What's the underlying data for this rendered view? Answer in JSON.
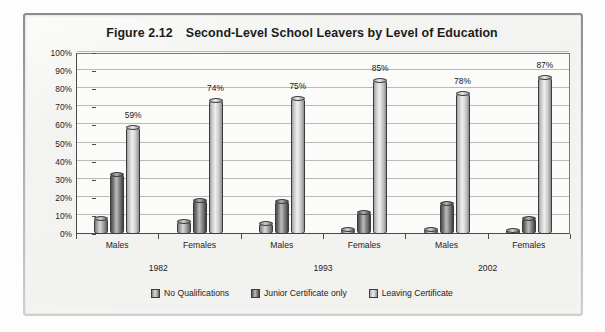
{
  "figure": {
    "label": "Figure 2.12",
    "title": "Second-Level School Leavers by Level of Education"
  },
  "chart_data": {
    "type": "bar",
    "xlabel": "",
    "ylabel": "",
    "ylim": [
      0,
      100
    ],
    "yticks": [
      "0%",
      "10%",
      "20%",
      "30%",
      "40%",
      "50%",
      "60%",
      "70%",
      "80%",
      "90%",
      "100%"
    ],
    "grid": true,
    "legend_position": "bottom",
    "categories": [
      "Males",
      "Females",
      "Males",
      "Females",
      "Males",
      "Females"
    ],
    "group_labels": [
      "1982",
      "1993",
      "2002"
    ],
    "series": [
      {
        "name": "No Qualifications",
        "values": [
          9,
          7,
          6,
          3,
          3,
          2
        ]
      },
      {
        "name": "Junior Certificate only",
        "values": [
          33,
          19,
          18,
          12,
          17,
          9
        ]
      },
      {
        "name": "Leaving Certificate",
        "values": [
          59,
          74,
          75,
          85,
          78,
          87
        ]
      }
    ],
    "data_labels": [
      "59%",
      "74%",
      "75%",
      "85%",
      "78%",
      "87%"
    ]
  },
  "yaxis": {
    "ticks": [
      "100%",
      "90%",
      "80%",
      "70%",
      "60%",
      "50%",
      "40%",
      "30%",
      "20%",
      "10%",
      "0%"
    ]
  },
  "xaxis": {
    "categories": [
      "Males",
      "Females",
      "Males",
      "Females",
      "Males",
      "Females"
    ],
    "years": [
      "1982",
      "1993",
      "2002"
    ]
  },
  "legend": {
    "items": [
      {
        "label": "No Qualifications"
      },
      {
        "label": "Junior Certificate only"
      },
      {
        "label": "Leaving Certificate"
      }
    ]
  },
  "colors": {
    "series_no_qualifications": "#a6a6a6",
    "series_junior_certificate": "#6e6e6e",
    "series_leaving_certificate": "#dcdcdc",
    "axis": "#4a4a4a",
    "gridline": "#b9b9b5",
    "plot_background": "#fbfbf9",
    "page_background": "#f2f2ef"
  }
}
